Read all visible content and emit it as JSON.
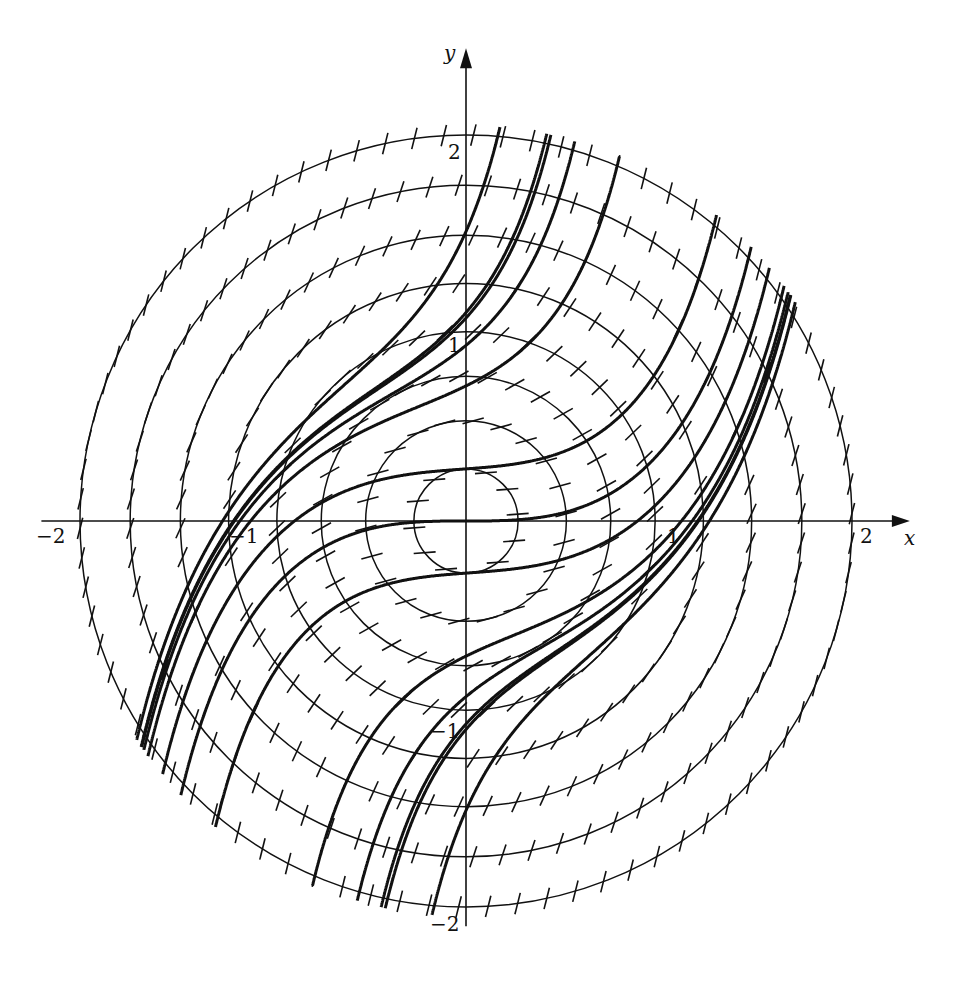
{
  "figure": {
    "colors": {
      "ink": "#111111",
      "background": "#ffffff"
    },
    "axes": {
      "x_label": "x",
      "y_label": "y",
      "x_ticks": [
        {
          "value": -2,
          "label": "−2"
        },
        {
          "value": -1,
          "label": "−1"
        },
        {
          "value": 1,
          "label": "1"
        },
        {
          "value": 2,
          "label": "2"
        }
      ],
      "y_ticks": [
        {
          "value": 2,
          "label": "2"
        },
        {
          "value": 1,
          "label": "1"
        },
        {
          "value": -1,
          "label": "−1"
        },
        {
          "value": -2,
          "label": "−2"
        }
      ],
      "origin_px": [
        466,
        521
      ],
      "scale_px_per_unit": 193,
      "x_range": [
        -2.2,
        2.3
      ],
      "y_range": [
        -2.1,
        2.45
      ]
    },
    "isoclines": {
      "equation": "x^2 + y^2 = C (slope C)",
      "radii": [
        0.27,
        0.52,
        0.75,
        0.98,
        1.23,
        1.48,
        1.74,
        2.0
      ],
      "ticks_per_circle": [
        12,
        22,
        32,
        42,
        52,
        62,
        72,
        82
      ]
    },
    "solution_curves": {
      "initial_y_at_x0": [
        -1.5,
        -1.08,
        -0.7,
        -0.27,
        0.0,
        0.27,
        0.7,
        1.08,
        1.5
      ],
      "extra_curves_from_points": [
        {
          "x0": 1.2,
          "y0": 0.0
        },
        {
          "x0": -1.2,
          "y0": 0.0
        },
        {
          "x0": 1.45,
          "y0": 0.5
        },
        {
          "x0": -1.45,
          "y0": -0.5
        }
      ],
      "clip_radius": 2.05
    }
  }
}
